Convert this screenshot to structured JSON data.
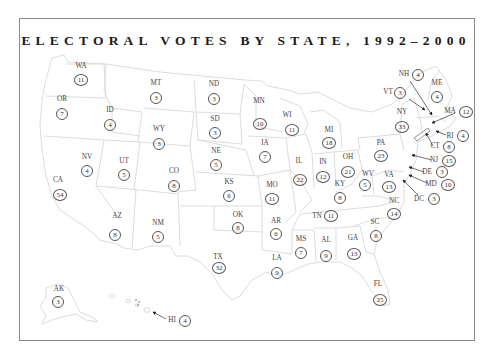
{
  "title": "ELECTORAL VOTES BY STATE, 1992–2000",
  "colors": {
    "border": "#8a8a8a",
    "state_outline": "#d6d6d6",
    "text": "#333333",
    "title": "#1a1a1a"
  },
  "states": [
    {
      "abbr": "WA",
      "votes": "11",
      "lx": 81,
      "ly": 67,
      "cx": 81,
      "cy": 80
    },
    {
      "abbr": "OR",
      "votes": "7",
      "lx": 62,
      "ly": 100,
      "cx": 62,
      "cy": 114
    },
    {
      "abbr": "ID",
      "votes": "4",
      "lx": 110,
      "ly": 111,
      "cx": 110,
      "cy": 125
    },
    {
      "abbr": "MT",
      "votes": "3",
      "lx": 156,
      "ly": 84,
      "cx": 156,
      "cy": 98
    },
    {
      "abbr": "WY",
      "votes": "3",
      "lx": 159,
      "ly": 130,
      "cx": 159,
      "cy": 144
    },
    {
      "abbr": "ND",
      "votes": "3",
      "lx": 214,
      "ly": 85,
      "cx": 214,
      "cy": 99
    },
    {
      "abbr": "SD",
      "votes": "3",
      "lx": 215,
      "ly": 120,
      "cx": 215,
      "cy": 133
    },
    {
      "abbr": "MN",
      "votes": "10",
      "lx": 259,
      "ly": 102,
      "cx": 260,
      "cy": 124
    },
    {
      "abbr": "WI",
      "votes": "11",
      "lx": 287,
      "ly": 116,
      "cx": 292,
      "cy": 130
    },
    {
      "abbr": "MI",
      "votes": "18",
      "lx": 329,
      "ly": 131,
      "cx": 329,
      "cy": 143
    },
    {
      "abbr": "NV",
      "votes": "4",
      "lx": 87,
      "ly": 158,
      "cx": 87,
      "cy": 171
    },
    {
      "abbr": "UT",
      "votes": "5",
      "lx": 124,
      "ly": 162,
      "cx": 124,
      "cy": 175
    },
    {
      "abbr": "CO",
      "votes": "8",
      "lx": 174,
      "ly": 172,
      "cx": 174,
      "cy": 186
    },
    {
      "abbr": "NE",
      "votes": "5",
      "lx": 216,
      "ly": 152,
      "cx": 216,
      "cy": 165
    },
    {
      "abbr": "KS",
      "votes": "6",
      "lx": 229,
      "ly": 183,
      "cx": 229,
      "cy": 196
    },
    {
      "abbr": "IA",
      "votes": "7",
      "lx": 265,
      "ly": 144,
      "cx": 265,
      "cy": 157
    },
    {
      "abbr": "IL",
      "votes": "22",
      "lx": 299,
      "ly": 162,
      "cx": 300,
      "cy": 180
    },
    {
      "abbr": "IN",
      "votes": "12",
      "lx": 323,
      "ly": 163,
      "cx": 323,
      "cy": 177
    },
    {
      "abbr": "OH",
      "votes": "21",
      "lx": 348,
      "ly": 158,
      "cx": 348,
      "cy": 172
    },
    {
      "abbr": "CA",
      "votes": "54",
      "lx": 58,
      "ly": 181,
      "cx": 60,
      "cy": 195
    },
    {
      "abbr": "MO",
      "votes": "11",
      "lx": 272,
      "ly": 186,
      "cx": 272,
      "cy": 199
    },
    {
      "abbr": "KY",
      "votes": "8",
      "lx": 340,
      "ly": 185,
      "cx": 340,
      "cy": 198
    },
    {
      "abbr": "WV",
      "votes": "5",
      "lx": 368,
      "ly": 175,
      "cx": 365,
      "cy": 185
    },
    {
      "abbr": "AZ",
      "votes": "8",
      "lx": 117,
      "ly": 217,
      "cx": 115,
      "cy": 235
    },
    {
      "abbr": "NM",
      "votes": "5",
      "lx": 158,
      "ly": 224,
      "cx": 158,
      "cy": 237
    },
    {
      "abbr": "OK",
      "votes": "8",
      "lx": 238,
      "ly": 216,
      "cx": 238,
      "cy": 228
    },
    {
      "abbr": "AR",
      "votes": "6",
      "lx": 276,
      "ly": 222,
      "cx": 276,
      "cy": 234
    },
    {
      "abbr": "TN",
      "votes": "11",
      "lx": 317,
      "ly": 217,
      "cx": 331,
      "cy": 216
    },
    {
      "abbr": "NC",
      "votes": "14",
      "lx": 394,
      "ly": 202,
      "cx": 394,
      "cy": 214
    },
    {
      "abbr": "SC",
      "votes": "8",
      "lx": 375,
      "ly": 223,
      "cx": 376,
      "cy": 236
    },
    {
      "abbr": "TX",
      "votes": "32",
      "lx": 218,
      "ly": 258,
      "cx": 219,
      "cy": 268
    },
    {
      "abbr": "MS",
      "votes": "7",
      "lx": 301,
      "ly": 240,
      "cx": 301,
      "cy": 253
    },
    {
      "abbr": "AL",
      "votes": "9",
      "lx": 326,
      "ly": 241,
      "cx": 326,
      "cy": 256
    },
    {
      "abbr": "GA",
      "votes": "13",
      "lx": 353,
      "ly": 239,
      "cx": 354,
      "cy": 254
    },
    {
      "abbr": "LA",
      "votes": "9",
      "lx": 277,
      "ly": 259,
      "cx": 277,
      "cy": 273
    },
    {
      "abbr": "FL",
      "votes": "25",
      "lx": 378,
      "ly": 285,
      "cx": 380,
      "cy": 300
    },
    {
      "abbr": "AK",
      "votes": "3",
      "lx": 59,
      "ly": 290,
      "cx": 58,
      "cy": 302
    },
    {
      "abbr": "PA",
      "votes": "23",
      "lx": 381,
      "ly": 144,
      "cx": 381,
      "cy": 156
    },
    {
      "abbr": "VA",
      "votes": "13",
      "lx": 389,
      "ly": 176,
      "cx": 389,
      "cy": 187
    },
    {
      "abbr": "NY",
      "votes": "33",
      "lx": 402,
      "ly": 113,
      "cx": 402,
      "cy": 127
    }
  ],
  "callouts": [
    {
      "abbr": "NH",
      "votes": "4",
      "lx": 404,
      "ly": 75,
      "cx": 418,
      "cy": 75,
      "ax1": 410,
      "ay1": 81,
      "ax2": 432,
      "ay2": 115
    },
    {
      "abbr": "VT",
      "votes": "3",
      "lx": 388,
      "ly": 93,
      "cx": 400,
      "cy": 93,
      "ax1": 409,
      "ay1": 99,
      "ax2": 425,
      "ay2": 110
    },
    {
      "abbr": "ME",
      "votes": "4",
      "lx": 437,
      "ly": 84,
      "cx": 437,
      "cy": 97,
      "ax1": 0,
      "ay1": 0,
      "ax2": 0,
      "ay2": 0
    },
    {
      "abbr": "MA",
      "votes": "12",
      "lx": 450,
      "ly": 112,
      "cx": 466,
      "cy": 112,
      "ax1": 455,
      "ay1": 113,
      "ax2": 432,
      "ay2": 123
    },
    {
      "abbr": "RI",
      "votes": "4",
      "lx": 450,
      "ly": 137,
      "cx": 463,
      "cy": 136,
      "ax1": 446,
      "ay1": 135,
      "ax2": 436,
      "ay2": 131
    },
    {
      "abbr": "CT",
      "votes": "8",
      "lx": 435,
      "ly": 147,
      "cx": 449,
      "cy": 147,
      "ax1": 433,
      "ay1": 146,
      "ax2": 426,
      "ay2": 133
    },
    {
      "abbr": "NJ",
      "votes": "15",
      "lx": 434,
      "ly": 161,
      "cx": 449,
      "cy": 161,
      "ax1": 432,
      "ay1": 160,
      "ax2": 412,
      "ay2": 155
    },
    {
      "abbr": "DE",
      "votes": "3",
      "lx": 427,
      "ly": 173,
      "cx": 442,
      "cy": 172,
      "ax1": 424,
      "ay1": 172,
      "ax2": 409,
      "ay2": 167
    },
    {
      "abbr": "MD",
      "votes": "10",
      "lx": 431,
      "ly": 185,
      "cx": 448,
      "cy": 185,
      "ax1": 427,
      "ay1": 183,
      "ax2": 409,
      "ay2": 175
    },
    {
      "abbr": "DC",
      "votes": "3",
      "lx": 419,
      "ly": 200,
      "cx": 434,
      "cy": 199,
      "ax1": 418,
      "ay1": 195,
      "ax2": 403,
      "ay2": 180
    },
    {
      "abbr": "HI",
      "votes": "4",
      "lx": 172,
      "ly": 321,
      "cx": 185,
      "cy": 321,
      "ax1": 166,
      "ay1": 319,
      "ax2": 153,
      "ay2": 312
    }
  ]
}
